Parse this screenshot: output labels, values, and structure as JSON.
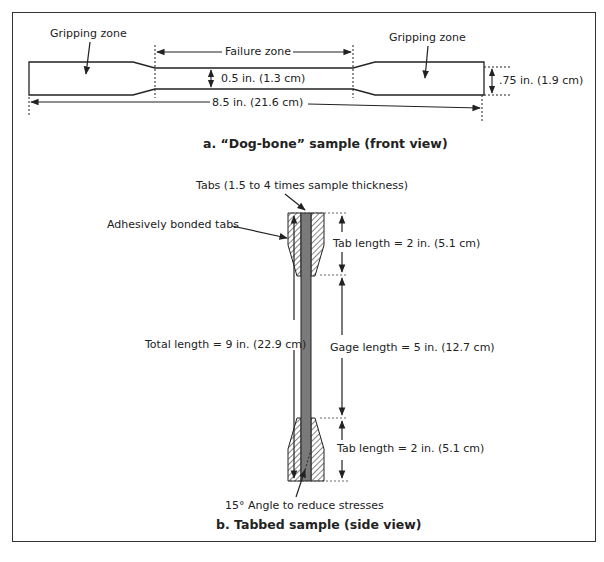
{
  "part_a": {
    "caption": "a. “Dog-bone” sample (front view)",
    "labels": {
      "gripping_zone_left": "Gripping zone",
      "gripping_zone_right": "Gripping zone",
      "failure_zone": "Failure zone",
      "narrow_width": "0.5 in. (1.3 cm)",
      "wide_width": ".75 in. (1.9 cm)",
      "total_length": "8.5 in. (21.6 cm)"
    }
  },
  "part_b": {
    "caption": "b. Tabbed sample (side view)",
    "labels": {
      "tabs_note": "Tabs (1.5 to 4 times sample thickness)",
      "adhesive_tabs": "Adhesively bonded tabs",
      "tab_length_top": "Tab length = 2 in. (5.1 cm)",
      "gage_length": "Gage length = 5 in. (12.7 cm)",
      "total_length": "Total length = 9 in. (22.9 cm)",
      "tab_length_bottom": "Tab length = 2 in. (5.1 cm)",
      "angle_note": "15° Angle to reduce stresses"
    }
  },
  "colors": {
    "line": "#222222",
    "specimen_core": "#777777",
    "background": "#ffffff"
  }
}
